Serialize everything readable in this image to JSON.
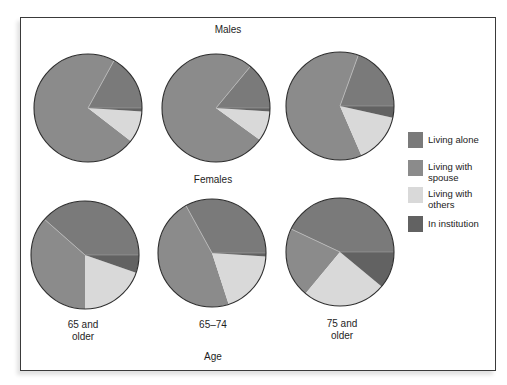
{
  "chart_data": {
    "type": "pie",
    "title": "",
    "xlabel": "Age",
    "groups": [
      "Males",
      "Females"
    ],
    "categories": [
      "65 and older",
      "65–74",
      "75 and older"
    ],
    "legend": [
      "Living alone",
      "Living with spouse",
      "Living with others",
      "In institution"
    ],
    "colors": {
      "Living alone": "#7a7a7a",
      "Living with spouse": "#8b8b8b",
      "Living with others": "#d9d9d9",
      "In institution": "#626262"
    },
    "series": [
      {
        "group": "Males",
        "age": "65 and older",
        "values": {
          "Living alone": 17,
          "Living with spouse": 72.5,
          "Living with others": 9.5,
          "In institution": 1
        }
      },
      {
        "group": "Males",
        "age": "65–74",
        "values": {
          "Living alone": 14,
          "Living with spouse": 76,
          "Living with others": 9,
          "In institution": 1
        }
      },
      {
        "group": "Males",
        "age": "75 and older",
        "values": {
          "Living alone": 19.5,
          "Living with spouse": 62,
          "Living with others": 15,
          "In institution": 3.5
        }
      },
      {
        "group": "Females",
        "age": "65 and older",
        "values": {
          "Living alone": 38.5,
          "Living with spouse": 36.5,
          "Living with others": 19.7,
          "In institution": 5.3
        }
      },
      {
        "group": "Females",
        "age": "65–74",
        "values": {
          "Living alone": 33,
          "Living with spouse": 47,
          "Living with others": 19,
          "In institution": 1
        }
      },
      {
        "group": "Females",
        "age": "75 and older",
        "values": {
          "Living alone": 43,
          "Living with spouse": 21,
          "Living with others": 25,
          "In institution": 11
        }
      }
    ],
    "legend_position": "right",
    "units": "percent"
  },
  "labels": {
    "males_title": "Males",
    "females_title": "Females",
    "axis_title": "Age",
    "ages": [
      "65 and\nolder",
      "65–74",
      "75 and\nolder"
    ],
    "legend": [
      "Living alone",
      "Living with\nspouse",
      "Living with\nothers",
      "In institution"
    ]
  }
}
